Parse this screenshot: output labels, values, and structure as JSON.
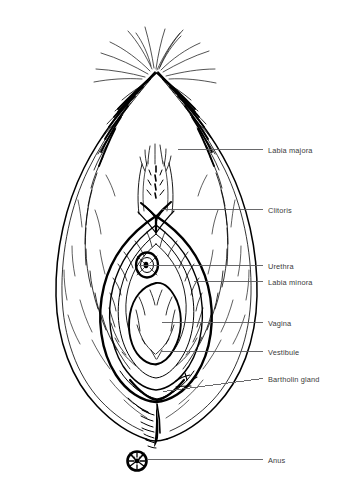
{
  "figure": {
    "title_fragment": "",
    "background_color": "#ffffff",
    "ink_color": "#000000",
    "leader_line_color": "#59595b",
    "label_text_color": "#3a3a3a"
  },
  "labels": [
    {
      "id": "labia-majora",
      "text": "Labia majora",
      "text_x": 268,
      "text_y": 146,
      "leader": {
        "x1": 178,
        "y1": 149.5,
        "x2": 263,
        "y2": 149.5
      }
    },
    {
      "id": "clitoris",
      "text": "Clitoris",
      "text_x": 268,
      "text_y": 206,
      "leader": {
        "x1": 161,
        "y1": 209.5,
        "x2": 263,
        "y2": 209.5
      }
    },
    {
      "id": "urethra",
      "text": "Urethra",
      "text_x": 268,
      "text_y": 262,
      "leader": {
        "x1": 139,
        "y1": 265.5,
        "x2": 263,
        "y2": 265.5
      }
    },
    {
      "id": "labia-minora",
      "text": "Labia minora",
      "text_x": 268,
      "text_y": 278,
      "leader": {
        "x1": 194,
        "y1": 281.5,
        "x2": 263,
        "y2": 281.5
      }
    },
    {
      "id": "vagina",
      "text": "Vagina",
      "text_x": 268,
      "text_y": 319,
      "leader": {
        "x1": 162,
        "y1": 322.5,
        "x2": 263,
        "y2": 322.5
      }
    },
    {
      "id": "vestibule",
      "text": "Vestibule",
      "text_x": 268,
      "text_y": 348,
      "leader": {
        "x1": 162,
        "y1": 351.5,
        "x2": 263,
        "y2": 351.5
      }
    },
    {
      "id": "bartholin-gland",
      "text": "Bartholin gland",
      "text_x": 268,
      "text_y": 375,
      "leader": {
        "x1": 163,
        "y1": 391.5,
        "x2": 263,
        "y2": 378.5
      }
    },
    {
      "id": "anus",
      "text": "Anus",
      "text_x": 268,
      "text_y": 456,
      "leader": {
        "x1": 148,
        "y1": 459.5,
        "x2": 263,
        "y2": 459.5
      }
    }
  ]
}
